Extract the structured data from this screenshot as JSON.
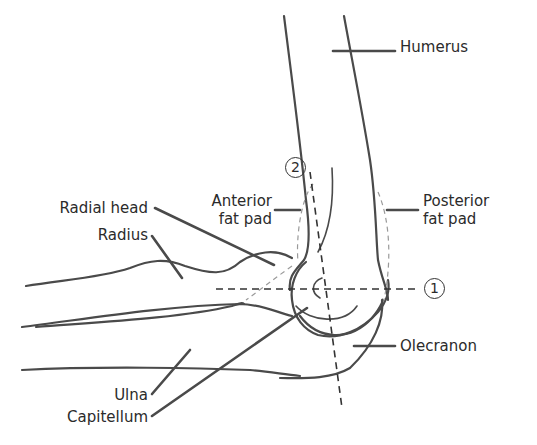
{
  "diagram": {
    "labels": {
      "humerus": "Humerus",
      "anterior_fat_pad": [
        "Anterior",
        "fat pad"
      ],
      "posterior_fat_pad": [
        "Posterior",
        "fat pad"
      ],
      "radial_head": "Radial head",
      "radius": "Radius",
      "olecranon": "Olecranon",
      "ulna": "Ulna",
      "capitellum": "Capitellum"
    },
    "markers": {
      "line_1": "1",
      "line_2": "2"
    },
    "colors": {
      "line": "#4a4a4a",
      "dashed_fat_pad": "#9a9a9a",
      "text": "#2b2b2b",
      "background": "#ffffff"
    }
  }
}
